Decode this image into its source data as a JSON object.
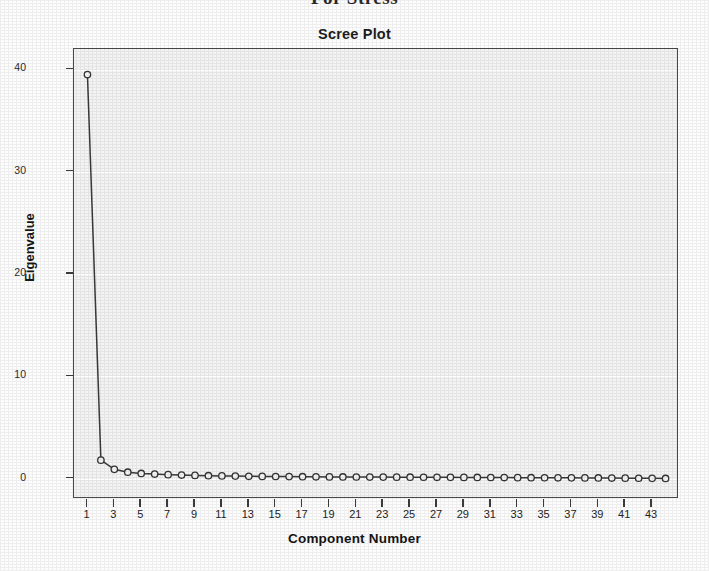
{
  "document": {
    "header_text": "For Stress"
  },
  "chart_data": {
    "type": "line",
    "title": "Scree Plot",
    "xlabel": "Component Number",
    "ylabel": "Eigenvalue",
    "xlim": [
      0,
      45
    ],
    "ylim": [
      -2,
      42
    ],
    "grid": true,
    "legend": "none",
    "marker": "open-circle",
    "line_color": "#3a3a3a",
    "marker_edge_color": "#333333",
    "marker_face_color": "#f3f3f3",
    "plot_background": "#f3f3f3",
    "frame_color": "#4a4a4a",
    "y_ticks": [
      0,
      10,
      20,
      30,
      40
    ],
    "y_tick_labels": [
      "0",
      "10",
      "20",
      "30",
      "40"
    ],
    "x_ticks": [
      1,
      3,
      5,
      7,
      9,
      11,
      13,
      15,
      17,
      19,
      21,
      23,
      25,
      27,
      29,
      31,
      33,
      35,
      37,
      39,
      41,
      43
    ],
    "x_tick_labels": [
      "1",
      "3",
      "5",
      "7",
      "9",
      "11",
      "13",
      "15",
      "17",
      "19",
      "21",
      "23",
      "25",
      "27",
      "29",
      "31",
      "33",
      "35",
      "37",
      "39",
      "41",
      "43"
    ],
    "x": [
      1,
      2,
      3,
      4,
      5,
      6,
      7,
      8,
      9,
      10,
      11,
      12,
      13,
      14,
      15,
      16,
      17,
      18,
      19,
      20,
      21,
      22,
      23,
      24,
      25,
      26,
      27,
      28,
      29,
      30,
      31,
      32,
      33,
      34,
      35,
      36,
      37,
      38,
      39,
      40,
      41,
      42,
      43,
      44
    ],
    "values": [
      39.5,
      1.8,
      0.9,
      0.62,
      0.5,
      0.44,
      0.38,
      0.34,
      0.31,
      0.28,
      0.26,
      0.24,
      0.22,
      0.21,
      0.2,
      0.19,
      0.18,
      0.17,
      0.16,
      0.155,
      0.15,
      0.145,
      0.14,
      0.135,
      0.13,
      0.125,
      0.12,
      0.115,
      0.11,
      0.105,
      0.1,
      0.095,
      0.09,
      0.085,
      0.08,
      0.075,
      0.07,
      0.065,
      0.06,
      0.05,
      0.04,
      0.03,
      0.02,
      0.01
    ],
    "series": [
      {
        "name": "Eigenvalue",
        "values": [
          39.5,
          1.8,
          0.9,
          0.62,
          0.5,
          0.44,
          0.38,
          0.34,
          0.31,
          0.28,
          0.26,
          0.24,
          0.22,
          0.21,
          0.2,
          0.19,
          0.18,
          0.17,
          0.16,
          0.155,
          0.15,
          0.145,
          0.14,
          0.135,
          0.13,
          0.125,
          0.12,
          0.115,
          0.11,
          0.105,
          0.1,
          0.095,
          0.09,
          0.085,
          0.08,
          0.075,
          0.07,
          0.065,
          0.06,
          0.05,
          0.04,
          0.03,
          0.02,
          0.01
        ]
      }
    ]
  }
}
